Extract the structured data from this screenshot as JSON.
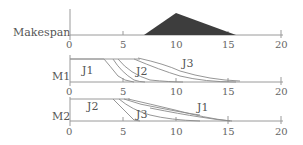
{
  "diagram": {
    "type": "schedule-diagram",
    "x_axis": {
      "min": 0,
      "max": 20,
      "ticks": [
        "0",
        "5",
        "10",
        "15",
        "20"
      ]
    },
    "makespan": {
      "label": "Makespan",
      "distribution": "triangular",
      "start": 7.0,
      "peak": 10,
      "end": 15.7,
      "fill_color": "#3d3d3d"
    },
    "machines": [
      {
        "label": "M1",
        "jobs": [
          {
            "label": "J1",
            "order": 1
          },
          {
            "label": "J2",
            "order": 2
          },
          {
            "label": "J3",
            "order": 3
          }
        ]
      },
      {
        "label": "M2",
        "jobs": [
          {
            "label": "J2",
            "order": 1
          },
          {
            "label": "J3",
            "order": 2
          },
          {
            "label": "J1",
            "order": 3
          }
        ]
      }
    ],
    "colors": {
      "axis": "#9a9a9a",
      "text": "#555555",
      "curve": "#8a8a8a",
      "fill": "#3d3d3d"
    }
  }
}
